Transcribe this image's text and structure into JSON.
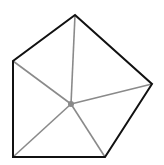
{
  "diagram": {
    "type": "pentagon-with-center-point",
    "width": 164,
    "height": 165,
    "colors": {
      "background": "#ffffff",
      "outline": "#111111",
      "spokes": "#8a8a8a",
      "center_point": "#8a8a8a"
    },
    "vertices": [
      {
        "id": "top",
        "x": 75,
        "y": 15
      },
      {
        "id": "right",
        "x": 152,
        "y": 84
      },
      {
        "id": "bottom-right",
        "x": 105,
        "y": 157
      },
      {
        "id": "bottom-left",
        "x": 13,
        "y": 157
      },
      {
        "id": "left",
        "x": 13,
        "y": 61
      }
    ],
    "center": {
      "x": 71,
      "y": 104,
      "r": 3
    }
  }
}
